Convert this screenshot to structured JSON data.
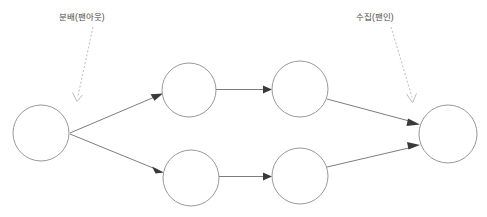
{
  "diagram": {
    "type": "flow-topology",
    "background_color": "#ffffff",
    "node_stroke_color": "#8c8c8c",
    "edge_color": "#7d7d7d",
    "arrowhead_color": "#3a3a3a",
    "annotation_color": "#b3b3b3",
    "annotation_text_color": "#4a4a4a",
    "annotations": [
      {
        "id": "fanout",
        "text": "분배(팬아웃)",
        "points_to": "source-node",
        "line_style": "dashed",
        "x": 59,
        "y": 12
      },
      {
        "id": "fanin",
        "text": "수집(팬인)",
        "points_to": "sink-node",
        "line_style": "dashed",
        "x": 356,
        "y": 12
      }
    ],
    "nodes": [
      {
        "id": "source",
        "label": "",
        "cx": 41,
        "cy": 133,
        "r": 28
      },
      {
        "id": "top-stage-1",
        "label": "",
        "cx": 189,
        "cy": 90,
        "r": 27
      },
      {
        "id": "top-stage-2",
        "label": "",
        "cx": 300,
        "cy": 89,
        "r": 28
      },
      {
        "id": "bottom-stage-1",
        "label": "",
        "cx": 191,
        "cy": 178,
        "r": 28
      },
      {
        "id": "bottom-stage-2",
        "label": "",
        "cx": 300,
        "cy": 176,
        "r": 28
      },
      {
        "id": "sink",
        "label": "",
        "cx": 448,
        "cy": 134,
        "r": 29
      }
    ],
    "edges": [
      {
        "from": "source",
        "to": "top-stage-1",
        "style": "solid",
        "arrow": true
      },
      {
        "from": "source",
        "to": "bottom-stage-1",
        "style": "solid",
        "arrow": true
      },
      {
        "from": "top-stage-1",
        "to": "top-stage-2",
        "style": "solid",
        "arrow": true
      },
      {
        "from": "bottom-stage-1",
        "to": "bottom-stage-2",
        "style": "solid",
        "arrow": true
      },
      {
        "from": "top-stage-2",
        "to": "sink",
        "style": "solid",
        "arrow": true
      },
      {
        "from": "bottom-stage-2",
        "to": "sink",
        "style": "solid",
        "arrow": true
      }
    ]
  }
}
